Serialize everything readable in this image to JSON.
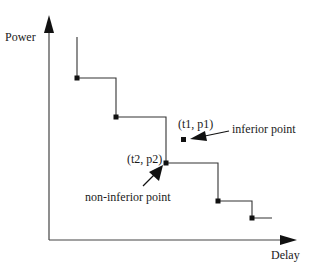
{
  "diagram": {
    "axes": {
      "y_label": "Power",
      "x_label": "Delay"
    },
    "annotations": {
      "inferior_point_coords": "(t1, p1)",
      "inferior_point_label": "inferior point",
      "non_inferior_point_coords": "(t2, p2)",
      "non_inferior_point_label": "non-inferior point"
    },
    "colors": {
      "axis": "#1a1a1a",
      "curve": "#333333",
      "point": "#111111"
    }
  }
}
